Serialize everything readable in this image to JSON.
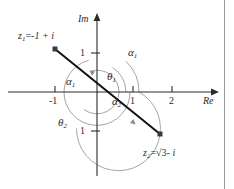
{
  "figure": {
    "background": "#ffffff",
    "axis_color": "#2b2b2b",
    "arc_color": "#8a8a8a",
    "vector_color": "#1a1a1a",
    "border_color": "#9a9a9a",
    "width": 234,
    "height": 189
  },
  "axes": {
    "imaginary": {
      "name": "Im",
      "x": 97,
      "top": 14,
      "bottom": 176
    },
    "real": {
      "name": "Re",
      "y": 92,
      "left": 8,
      "right": 218
    },
    "origin": {
      "x": 97,
      "y": 92
    },
    "unit_x": 38,
    "unit_y": 39
  },
  "ticks": {
    "real": [
      {
        "label": "-1",
        "value": -1,
        "x": 55
      },
      {
        "label": "1",
        "value": 1,
        "x": 133
      },
      {
        "label": "2",
        "value": 2,
        "x": 172
      }
    ],
    "imaginary": [
      {
        "label": "1",
        "value": 1,
        "y": 53
      },
      {
        "label": "1",
        "value": -1,
        "y": 131
      }
    ]
  },
  "points": [
    {
      "id": "z1",
      "label_prefix": "z",
      "label_sub": "1",
      "label_eq": "=",
      "label_value": "-1 + i",
      "dot_x": 55,
      "dot_y": 49,
      "label_x": 18,
      "label_y": 31
    },
    {
      "id": "z2",
      "label_prefix": "z",
      "label_sub": "2",
      "label_eq": "=",
      "label_value_pre": "",
      "label_radicand": "3",
      "label_value_post": "- i",
      "dot_x": 160,
      "dot_y": 134,
      "label_x": 143,
      "label_y": 148
    }
  ],
  "vector_line": {
    "name": "line-through-z1-z2",
    "x1": 55,
    "y1": 49,
    "x2": 160,
    "y2": 134
  },
  "angle_labels": [
    {
      "name": "alpha-1-upper-right",
      "greek": "α",
      "sub": "1",
      "x": 128,
      "y": 47
    },
    {
      "name": "alpha-1-left",
      "greek": "α",
      "sub": "1",
      "x": 66,
      "y": 76
    },
    {
      "name": "theta-1",
      "greek": "θ",
      "sub": "1",
      "x": 107,
      "y": 71
    },
    {
      "name": "alpha-2",
      "greek": "α",
      "sub": "2",
      "x": 112,
      "y": 96
    },
    {
      "name": "theta-2",
      "greek": "θ",
      "sub": "2",
      "x": 58,
      "y": 117
    }
  ],
  "arcs": [
    {
      "name": "theta-1-inner-arc",
      "radius": 22,
      "note": "small arc from +Re axis counterclockwise to z1 direction"
    },
    {
      "name": "alpha-1-mid-arc",
      "radius": 33,
      "note": "medium arc near left of origin"
    },
    {
      "name": "theta-2-outer-arc",
      "radius": 42,
      "note": "large arc sweeping clockwise-down to z2 direction"
    }
  ]
}
